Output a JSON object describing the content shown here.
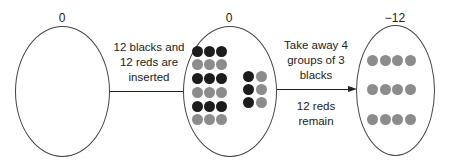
{
  "stages": [
    {
      "value": "0",
      "description": "empty"
    },
    {
      "value": "0",
      "description": "12 black and 12 red chips"
    },
    {
      "value": "−12",
      "description": "12 red chips"
    }
  ],
  "transitions": [
    {
      "lines": [
        "12 blacks and",
        "12 reds are",
        "inserted"
      ]
    },
    {
      "top_lines": [
        "Take away 4",
        "groups of 3",
        "blacks"
      ],
      "bottom_lines": [
        "12 reds",
        "remain"
      ]
    }
  ],
  "colors": {
    "black_chip": "#1c1c1c",
    "red_chip": "#8c8c8c",
    "outline": "#444444"
  }
}
